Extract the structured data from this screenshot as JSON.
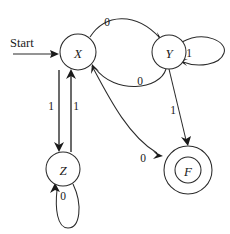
{
  "diagram": {
    "kind": "finite-state-machine",
    "background_color": "#ffffff",
    "stroke_color": "#2b2b2b",
    "text_color": "#1a1a1a",
    "start_label": "Start"
  },
  "states": [
    {
      "id": "X",
      "label": "X",
      "cx": 78,
      "cy": 52,
      "r": 18,
      "accepting": false
    },
    {
      "id": "Y",
      "label": "Y",
      "cx": 169,
      "cy": 52,
      "r": 17,
      "accepting": false
    },
    {
      "id": "Z",
      "label": "Z",
      "cx": 63,
      "cy": 169,
      "r": 17,
      "accepting": false
    },
    {
      "id": "F",
      "label": "F",
      "cx": 188,
      "cy": 170,
      "r": 24,
      "r_inner": 13,
      "accepting": true
    }
  ],
  "transitions": [
    {
      "id": "x-to-y",
      "from": "X",
      "to": "Y",
      "label": "0",
      "label_x": 107,
      "label_y": 22
    },
    {
      "id": "y-to-x",
      "from": "Y",
      "to": "X",
      "label": "0",
      "label_x": 140,
      "label_y": 81
    },
    {
      "id": "y-self",
      "from": "Y",
      "to": "Y",
      "label": "1",
      "label_x": 189,
      "label_y": 53
    },
    {
      "id": "x-to-z",
      "from": "X",
      "to": "Z",
      "label": "1",
      "label_x": 51,
      "label_y": 106
    },
    {
      "id": "z-to-x",
      "from": "Z",
      "to": "X",
      "label": "1",
      "label_x": 76,
      "label_y": 106
    },
    {
      "id": "z-self",
      "from": "Z",
      "to": "Z",
      "label": "0",
      "label_x": 63,
      "label_y": 196
    },
    {
      "id": "x-to-f",
      "from": "X",
      "to": "F",
      "label": "0",
      "label_x": 143,
      "label_y": 158
    },
    {
      "id": "y-to-f",
      "from": "Y",
      "to": "F",
      "label": "1",
      "label_x": 173,
      "label_y": 110
    }
  ]
}
